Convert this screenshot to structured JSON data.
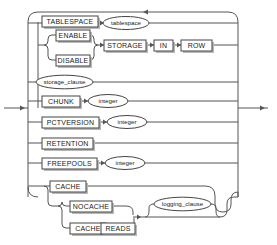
{
  "diagram": {
    "name": "LOB_storage_parameters",
    "type": "railroad-syntax-diagram",
    "colors": {
      "background": "#ffffff",
      "rail": "#555555",
      "box_border": "#444444",
      "box_fill": "#ffffff",
      "box_shadow": "#b8b8b8",
      "text": "#1a1a1a"
    },
    "entry_label": "",
    "exit_label": ""
  },
  "nodes": {
    "tablespace_keyword": "TABLESPACE",
    "tablespace_value": "tablespace",
    "enable": "ENABLE",
    "disable": "DISABLE",
    "storage": "STORAGE",
    "in": "IN",
    "row": "ROW",
    "storage_clause": "storage_clause",
    "chunk": "CHUNK",
    "chunk_integer": "integer",
    "pctversion": "PCTVERSION",
    "pctversion_integer": "integer",
    "retention": "RETENTION",
    "freepools": "FREEPOOLS",
    "freepools_integer": "integer",
    "cache": "CACHE",
    "nocache": "NOCACHE",
    "cache_reads_cache": "CACHE",
    "cache_reads_reads": "READS",
    "logging_clause": "logging_clause"
  },
  "branches": [
    {
      "id": "tablespace",
      "items": [
        "TABLESPACE",
        "tablespace"
      ],
      "kinds": [
        "keyword",
        "nonterminal"
      ]
    },
    {
      "id": "storage-in-row",
      "items": [
        "ENABLE",
        "DISABLE",
        "STORAGE",
        "IN",
        "ROW"
      ],
      "kinds": [
        "keyword",
        "keyword",
        "keyword",
        "keyword",
        "keyword"
      ]
    },
    {
      "id": "storage-clause",
      "items": [
        "storage_clause"
      ],
      "kinds": [
        "nonterminal"
      ]
    },
    {
      "id": "chunk",
      "items": [
        "CHUNK",
        "integer"
      ],
      "kinds": [
        "keyword",
        "nonterminal"
      ]
    },
    {
      "id": "pctversion",
      "items": [
        "PCTVERSION",
        "integer"
      ],
      "kinds": [
        "keyword",
        "nonterminal"
      ]
    },
    {
      "id": "retention",
      "items": [
        "RETENTION"
      ],
      "kinds": [
        "keyword"
      ]
    },
    {
      "id": "freepools",
      "items": [
        "FREEPOOLS",
        "integer"
      ],
      "kinds": [
        "keyword",
        "nonterminal"
      ]
    },
    {
      "id": "cache-group",
      "items": [
        "CACHE",
        "NOCACHE",
        "CACHE",
        "READS",
        "logging_clause"
      ],
      "kinds": [
        "keyword",
        "keyword",
        "keyword",
        "keyword",
        "nonterminal"
      ]
    }
  ]
}
